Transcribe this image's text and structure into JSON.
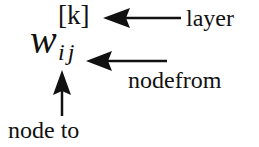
{
  "notation": {
    "base": "w",
    "superscript": "[k]",
    "subscript": "ij"
  },
  "labels": {
    "layer": "layer",
    "node_from": "nodefrom",
    "node_to": "node to"
  },
  "arrows": [
    {
      "name": "layer-arrow",
      "points_to": "superscript",
      "direction": "left"
    },
    {
      "name": "node-from-arrow",
      "points_to": "subscript j",
      "direction": "left"
    },
    {
      "name": "node-to-arrow",
      "points_to": "subscript i",
      "direction": "up"
    }
  ],
  "colors": {
    "ink": "#111111",
    "background": "#ffffff"
  }
}
